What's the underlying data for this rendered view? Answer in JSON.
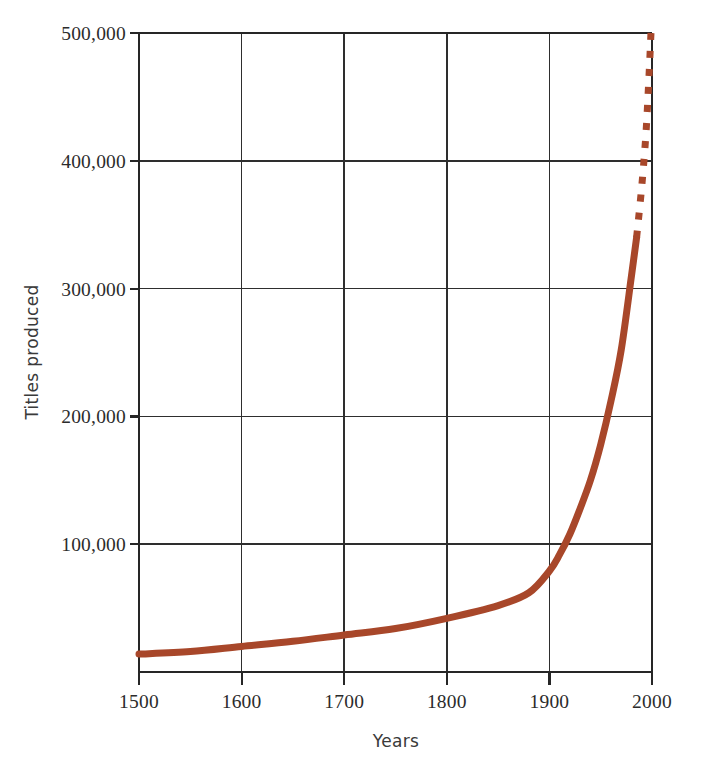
{
  "chart_data": {
    "type": "line",
    "title": "",
    "xlabel": "Years",
    "ylabel": "Titles produced",
    "xlim": [
      1500,
      2000
    ],
    "ylim": [
      0,
      500000
    ],
    "grid": true,
    "legend": false,
    "x_ticks": [
      1500,
      1600,
      1700,
      1800,
      1900,
      2000
    ],
    "x_tick_labels": [
      "1500",
      "1600",
      "1700",
      "1800",
      "1900",
      "2000"
    ],
    "y_ticks": [
      100000,
      200000,
      300000,
      400000,
      500000
    ],
    "y_tick_labels": [
      "100,000",
      "200,000",
      "300,000",
      "400,000",
      "500,000"
    ],
    "series": [
      {
        "name": "Titles produced",
        "style": "solid",
        "color": "#a8472a",
        "x": [
          1500,
          1550,
          1600,
          1650,
          1700,
          1750,
          1800,
          1850,
          1880,
          1900,
          1910,
          1920,
          1930,
          1940,
          1950,
          1960,
          1970,
          1980,
          1985
        ],
        "values": [
          14000,
          16000,
          20000,
          24000,
          29000,
          34000,
          42000,
          52000,
          62000,
          79000,
          92000,
          108000,
          128000,
          150000,
          178000,
          212000,
          252000,
          310000,
          340000
        ]
      },
      {
        "name": "Titles produced (projected)",
        "style": "dashed",
        "color": "#a8472a",
        "x": [
          1985,
          1990,
          1994,
          1997,
          1999
        ],
        "values": [
          340000,
          380000,
          420000,
          465000,
          500000
        ]
      }
    ],
    "annotations": []
  },
  "colors": {
    "series": "#a8472a",
    "grid": "#2e2e2e",
    "frame": "#262626",
    "text": "#2b2b2b",
    "background": "#ffffff"
  }
}
